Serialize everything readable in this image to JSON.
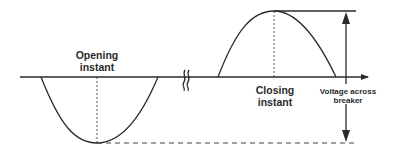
{
  "diagram": {
    "title": "",
    "labels": {
      "opening_line1": "Opening",
      "opening_line2": "instant",
      "closing_line1": "Closing",
      "closing_line2": "instant",
      "voltage_line1": "Voltage across",
      "voltage_line2": "breaker"
    },
    "elements": {
      "axis": "time-axis-arrow",
      "break_symbol": "axis-break",
      "negative_half_cycle": "negative-half-wave",
      "positive_half_cycle": "positive-half-wave",
      "measurement_arrow": "double-headed-voltage-arrow"
    },
    "colors": {
      "line": "#2a2a2a",
      "background": "#ffffff"
    }
  }
}
